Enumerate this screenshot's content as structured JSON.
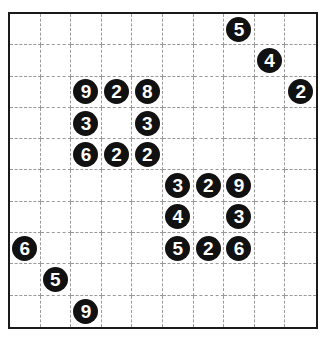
{
  "puzzle": {
    "rows": 10,
    "cols": 10,
    "colors": {
      "border": "#1a1a1a",
      "gridline": "#9a9a9a",
      "clue_fill": "#111111",
      "clue_text": "#ffffff"
    },
    "clues": [
      {
        "row": 0,
        "col": 7,
        "value": "5"
      },
      {
        "row": 1,
        "col": 8,
        "value": "4"
      },
      {
        "row": 2,
        "col": 2,
        "value": "9"
      },
      {
        "row": 2,
        "col": 3,
        "value": "2"
      },
      {
        "row": 2,
        "col": 4,
        "value": "8"
      },
      {
        "row": 2,
        "col": 9,
        "value": "2"
      },
      {
        "row": 3,
        "col": 2,
        "value": "3"
      },
      {
        "row": 3,
        "col": 4,
        "value": "3"
      },
      {
        "row": 4,
        "col": 2,
        "value": "6"
      },
      {
        "row": 4,
        "col": 3,
        "value": "2"
      },
      {
        "row": 4,
        "col": 4,
        "value": "2"
      },
      {
        "row": 5,
        "col": 5,
        "value": "3"
      },
      {
        "row": 5,
        "col": 6,
        "value": "2"
      },
      {
        "row": 5,
        "col": 7,
        "value": "9"
      },
      {
        "row": 6,
        "col": 5,
        "value": "4"
      },
      {
        "row": 6,
        "col": 7,
        "value": "3"
      },
      {
        "row": 7,
        "col": 0,
        "value": "6"
      },
      {
        "row": 7,
        "col": 5,
        "value": "5"
      },
      {
        "row": 7,
        "col": 6,
        "value": "2"
      },
      {
        "row": 7,
        "col": 7,
        "value": "6"
      },
      {
        "row": 8,
        "col": 1,
        "value": "5"
      },
      {
        "row": 9,
        "col": 2,
        "value": "9"
      }
    ]
  }
}
